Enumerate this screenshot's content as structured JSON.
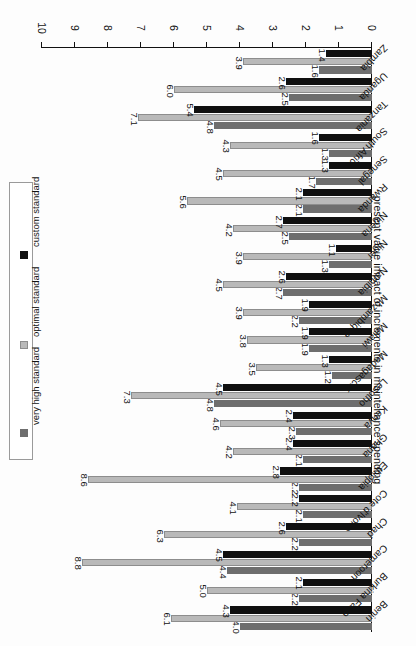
{
  "chart_data": {
    "type": "bar",
    "orientation": "horizontal-grouped",
    "title": "",
    "xlabel": "",
    "ylabel": "present value impact of increments in maintenance spending",
    "ylim": [
      0,
      10
    ],
    "ytick_labels": [
      "0",
      "1",
      "2",
      "3",
      "4",
      "5",
      "6",
      "7",
      "8",
      "9",
      "10"
    ],
    "ytick_values": [
      0,
      1,
      2,
      3,
      4,
      5,
      6,
      7,
      8,
      9,
      10
    ],
    "grid": false,
    "legend_position": "right",
    "categories": [
      "Benin",
      "Burkina Faso",
      "Cameroon",
      "Chad",
      "Cote d'Ivoire",
      "Ethiopia",
      "Ghana",
      "Kenya",
      "Lesotho",
      "Madagascar",
      "Malawi",
      "Mozambique",
      "Namibia",
      "Niger",
      "Nigeria",
      "Rwanda",
      "Senegal",
      "South Africa",
      "Tanzania",
      "Uganda",
      "Zambia"
    ],
    "series": [
      {
        "name": "very high standard",
        "color": "#6e6e6e",
        "values": [
          4.0,
          2.2,
          4.4,
          2.2,
          2.1,
          2.2,
          2.1,
          2.3,
          4.8,
          1.2,
          1.9,
          2.2,
          2.7,
          1.3,
          2.5,
          2.1,
          1.7,
          1.3,
          4.8,
          2.5,
          1.6
        ]
      },
      {
        "name": "optimal standard",
        "color": "#b9b9b9",
        "values": [
          6.1,
          5.0,
          8.8,
          6.3,
          4.1,
          8.6,
          4.2,
          4.6,
          7.3,
          3.5,
          3.8,
          3.9,
          4.5,
          3.9,
          4.2,
          5.6,
          4.5,
          4.3,
          7.1,
          6.0,
          3.9
        ]
      },
      {
        "name": "custom standard",
        "color": "#101010",
        "values": [
          4.3,
          2.1,
          4.5,
          2.6,
          2.2,
          2.8,
          2.4,
          2.4,
          4.5,
          1.3,
          1.9,
          1.9,
          2.6,
          1.1,
          2.7,
          2.1,
          1.3,
          1.6,
          5.4,
          2.6,
          1.4
        ]
      }
    ],
    "data_labels": {
      "Benin": {
        "very high standard": "4.0",
        "optimal standard": "6.1",
        "custom standard": "4.3"
      },
      "Burkina Faso": {
        "very high standard": "2.2",
        "optimal standard": "5.0",
        "custom standard": "2.1"
      },
      "Cameroon": {
        "very high standard": "4.4",
        "optimal standard": "8.8",
        "custom standard": "4.5"
      },
      "Chad": {
        "very high standard": "2.2",
        "optimal standard": "6.3",
        "custom standard": "2.6"
      },
      "Cote d'Ivoire": {
        "very high standard": "2.1",
        "optimal standard": "4.1",
        "custom standard": "2.2"
      },
      "Ethiopia": {
        "very high standard": "2.2",
        "optimal standard": "8.6",
        "custom standard": "2.8"
      },
      "Ghana": {
        "very high standard": "2.1",
        "optimal standard": "4.2",
        "custom standard": "2.4"
      },
      "Kenya": {
        "very high standard": "2.3",
        "optimal standard": "4.6",
        "custom standard": "2.4"
      },
      "Lesotho": {
        "very high standard": "4.8",
        "optimal standard": "7.3",
        "custom standard": "4.5"
      },
      "Madagascar": {
        "very high standard": "1.2",
        "optimal standard": "3.5",
        "custom standard": "1.3"
      },
      "Malawi": {
        "very high standard": "1.9",
        "optimal standard": "3.8",
        "custom standard": "1.9"
      },
      "Mozambique": {
        "very high standard": "2.2",
        "optimal standard": "3.9",
        "custom standard": "1.9"
      },
      "Namibia": {
        "very high standard": "2.7",
        "optimal standard": "4.5",
        "custom standard": "2.6"
      },
      "Niger": {
        "very high standard": "1.3",
        "optimal standard": "3.9",
        "custom standard": "1.1"
      },
      "Nigeria": {
        "very high standard": "2.5",
        "optimal standard": "4.2",
        "custom standard": "2.7"
      },
      "Rwanda": {
        "very high standard": "2.1",
        "optimal standard": "5.6",
        "custom standard": "2.1"
      },
      "Senegal": {
        "very high standard": "1.7",
        "optimal standard": "4.5",
        "custom standard": "1.3"
      },
      "South Africa": {
        "very high standard": "1.3",
        "optimal standard": "4.3",
        "custom standard": "1.6"
      },
      "Tanzania": {
        "very high standard": "4.8",
        "optimal standard": "7.1",
        "custom standard": "5.4"
      },
      "Uganda": {
        "very high standard": "2.5",
        "optimal standard": "6.0",
        "custom standard": "2.6"
      },
      "Zambia": {
        "very high standard": "1.6",
        "optimal standard": "3.9",
        "custom standard": "1.4"
      }
    }
  },
  "legend": {
    "items": [
      {
        "label": "very high standard",
        "color": "#6e6e6e"
      },
      {
        "label": "optimal standard",
        "color": "#b9b9b9"
      },
      {
        "label": "custom standard",
        "color": "#101010"
      }
    ]
  },
  "axis": {
    "title": "present value impact of increments in maintenance spending"
  }
}
